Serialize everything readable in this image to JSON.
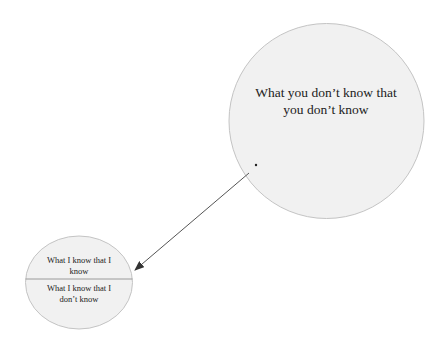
{
  "diagram": {
    "big_circle": {
      "label": "What you don’t know that you don’t know",
      "fill": "#f1f1f1",
      "stroke": "#c4c4c4"
    },
    "small_circle": {
      "top_label": "What I know that I know",
      "bottom_label": "What I know that I don’t know",
      "fill": "#f1f1f1",
      "stroke": "#c4c4c4"
    },
    "arrow": {
      "from": "big_circle",
      "to": "small_circle",
      "color": "#555555"
    }
  }
}
